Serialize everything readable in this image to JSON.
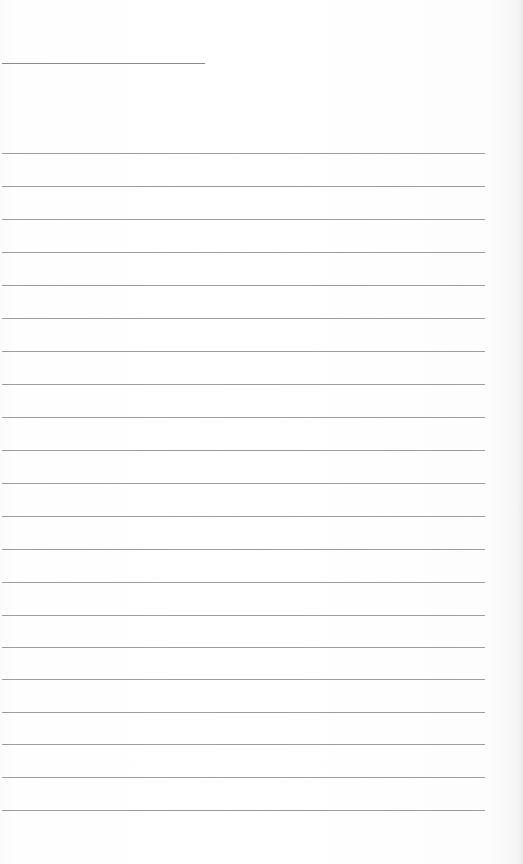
{
  "page": {
    "type": "lined-paper",
    "background_color": "#fdfdfd",
    "rule_color": "#9c9c9c",
    "title_line": {
      "x": 2,
      "y": 63,
      "width": 203
    },
    "rules": {
      "count": 21,
      "x": 2,
      "width": 483,
      "positions_y": [
        153,
        186,
        219,
        252,
        285,
        318,
        351,
        384,
        417,
        450,
        483,
        516,
        549,
        582,
        615,
        647,
        679,
        712,
        744,
        777,
        810
      ]
    }
  }
}
